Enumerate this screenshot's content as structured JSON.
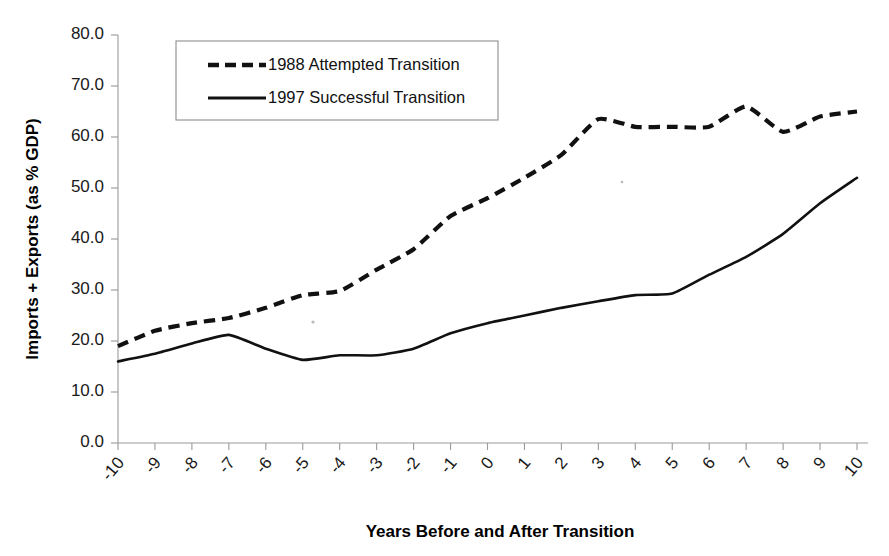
{
  "chart_data": {
    "type": "line",
    "title": "",
    "xlabel": "Years Before and After Transition",
    "ylabel": "Imports + Exports (as % GDP)",
    "x": [
      -10,
      -9,
      -8,
      -7,
      -6,
      -5,
      -4,
      -3,
      -2,
      -1,
      0,
      1,
      2,
      3,
      4,
      5,
      6,
      7,
      8,
      9,
      10
    ],
    "xtick_labels": [
      "-10",
      "-9",
      "-8",
      "-7",
      "-6",
      "-5",
      "-4",
      "-3",
      "-2",
      "-1",
      "0",
      "1",
      "2",
      "3",
      "4",
      "5",
      "6",
      "7",
      "8",
      "9",
      "10"
    ],
    "ytick_labels": [
      "0.0",
      "10.0",
      "20.0",
      "30.0",
      "40.0",
      "50.0",
      "60.0",
      "70.0",
      "80.0"
    ],
    "ytick_values": [
      0,
      10,
      20,
      30,
      40,
      50,
      60,
      70,
      80
    ],
    "ylim": [
      0,
      80
    ],
    "xlim": [
      -10,
      10
    ],
    "grid": false,
    "legend_position": "top-left-inside",
    "series": [
      {
        "name": "1988 Attempted Transition",
        "style": "dashed",
        "color": "#111111",
        "values": [
          16.0,
          17.5,
          19.5,
          21.2,
          18.5,
          16.3,
          17.2,
          17.2,
          18.5,
          21.5,
          23.5,
          25.0,
          26.5,
          27.8,
          29.0,
          29.3,
          33.0,
          36.5,
          41.0,
          47.0,
          52.0
        ]
      },
      {
        "name": "1997 Successful Transition",
        "style": "solid",
        "color": "#111111",
        "values": [
          19.0,
          22.0,
          23.5,
          24.5,
          26.5,
          29.0,
          29.8,
          34.0,
          38.0,
          44.5,
          48.0,
          52.0,
          56.5,
          63.5,
          62.0,
          62.0,
          62.0,
          66.0,
          61.0,
          64.0,
          65.0
        ]
      }
    ]
  },
  "legend": {
    "entries": [
      {
        "label": "1988 Attempted Transition",
        "style": "dashed"
      },
      {
        "label": "1997 Successful Transition",
        "style": "solid"
      }
    ]
  },
  "axes": {
    "y_title": "Imports + Exports (as % GDP)",
    "x_title": "Years Before and After Transition"
  }
}
